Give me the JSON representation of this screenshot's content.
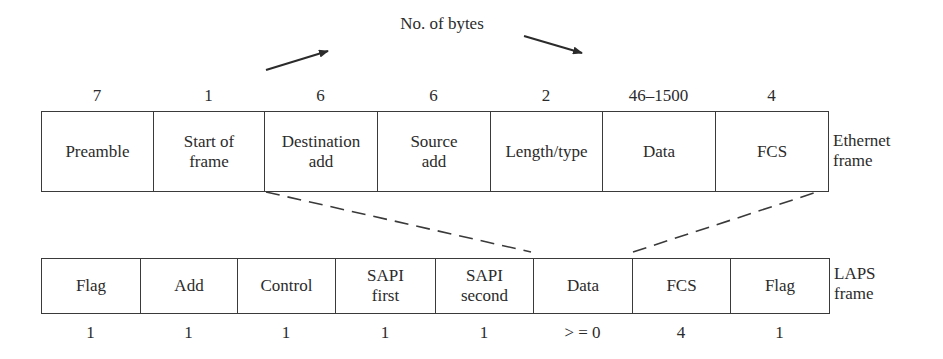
{
  "title": "No. of bytes",
  "ethernet_frame": {
    "label": "Ethernet\nframe",
    "fields": [
      {
        "name": "Preamble",
        "bytes": "7"
      },
      {
        "name": "Start of\nframe",
        "bytes": "1"
      },
      {
        "name": "Destination\nadd",
        "bytes": "6"
      },
      {
        "name": "Source\nadd",
        "bytes": "6"
      },
      {
        "name": "Length/type",
        "bytes": "2"
      },
      {
        "name": "Data",
        "bytes": "46–1500"
      },
      {
        "name": "FCS",
        "bytes": "4"
      }
    ]
  },
  "laps_frame": {
    "label": "LAPS\nframe",
    "fields": [
      {
        "name": "Flag",
        "bytes": "1"
      },
      {
        "name": "Add",
        "bytes": "1"
      },
      {
        "name": "Control",
        "bytes": "1"
      },
      {
        "name": "SAPI\nfirst",
        "bytes": "1"
      },
      {
        "name": "SAPI\nsecond",
        "bytes": "1"
      },
      {
        "name": "Data",
        "bytes": "> = 0"
      },
      {
        "name": "FCS",
        "bytes": "4"
      },
      {
        "name": "Flag",
        "bytes": "1"
      }
    ]
  },
  "mapping": {
    "description": "Ethernet fields from Destination add through FCS are encapsulated in LAPS Data field",
    "line_style": "dashed"
  },
  "colors": {
    "line": "#3a3a3a",
    "text": "#2b2b2b",
    "background": "#ffffff"
  }
}
